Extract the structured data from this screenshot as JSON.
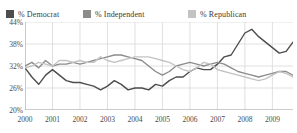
{
  "legend": {
    "items": [
      {
        "label": "% Democrat",
        "color": "#4d4d4d",
        "name": "democrat"
      },
      {
        "label": "% Independent",
        "color": "#8c8c8c",
        "name": "independent"
      },
      {
        "label": "% Republican",
        "color": "#c3c3c3",
        "name": "republican"
      }
    ]
  },
  "axes": {
    "y_ticks": [
      "44%",
      "38%",
      "32%",
      "26%",
      "20%"
    ],
    "x_ticks": [
      "2000",
      "2001",
      "2002",
      "2003",
      "2004",
      "2005",
      "2006",
      "2007",
      "2008",
      "2009"
    ]
  },
  "colors": {
    "democrat": "#4d4d4d",
    "independent": "#8c8c8c",
    "republican": "#c3c3c3",
    "grid": "#d8d8d8",
    "axis": "#a8a8a8",
    "text": "#4a4a4a"
  },
  "chart_data": {
    "type": "line",
    "title": "",
    "xlabel": "",
    "ylabel": "",
    "ylim": [
      20,
      44
    ],
    "xlim": [
      2000,
      2009.75
    ],
    "y_ticks": [
      20,
      26,
      32,
      38,
      44
    ],
    "x_ticks": [
      2000,
      2001,
      2002,
      2003,
      2004,
      2005,
      2006,
      2007,
      2008,
      2009
    ],
    "grid": true,
    "legend_position": "top",
    "series": [
      {
        "name": "% Democrat",
        "color": "#4d4d4d",
        "x": [
          2000,
          2000.25,
          2000.5,
          2000.75,
          2001,
          2001.25,
          2001.5,
          2001.75,
          2002,
          2002.25,
          2002.5,
          2002.75,
          2003,
          2003.25,
          2003.5,
          2003.75,
          2004,
          2004.25,
          2004.5,
          2004.75,
          2005,
          2005.25,
          2005.5,
          2005.75,
          2006,
          2006.25,
          2006.5,
          2006.75,
          2007,
          2007.25,
          2007.5,
          2007.75,
          2008,
          2008.25,
          2008.5,
          2008.75,
          2009,
          2009.25,
          2009.5,
          2009.75
        ],
        "values": [
          31.5,
          29.0,
          27.0,
          29.5,
          31.0,
          29.5,
          28.0,
          27.5,
          27.5,
          27.0,
          26.5,
          25.5,
          26.5,
          28.0,
          27.0,
          25.5,
          26.0,
          26.0,
          25.5,
          27.0,
          26.5,
          28.0,
          29.0,
          29.0,
          30.5,
          31.5,
          31.0,
          31.0,
          32.5,
          34.5,
          35.0,
          38.0,
          41.0,
          42.0,
          40.0,
          38.5,
          37.0,
          35.5,
          36.0,
          38.5
        ]
      },
      {
        "name": "% Independent",
        "color": "#8c8c8c",
        "x": [
          2000,
          2000.25,
          2000.5,
          2000.75,
          2001,
          2001.25,
          2001.5,
          2001.75,
          2002,
          2002.25,
          2002.5,
          2002.75,
          2003,
          2003.25,
          2003.5,
          2003.75,
          2004,
          2004.25,
          2004.5,
          2004.75,
          2005,
          2005.25,
          2005.5,
          2005.75,
          2006,
          2006.25,
          2006.5,
          2006.75,
          2007,
          2007.25,
          2007.5,
          2007.75,
          2008,
          2008.25,
          2008.5,
          2008.75,
          2009,
          2009.25,
          2009.5,
          2009.75
        ],
        "values": [
          32.0,
          33.0,
          31.5,
          33.5,
          32.0,
          32.5,
          32.5,
          33.0,
          32.5,
          33.0,
          33.5,
          34.0,
          34.5,
          35.0,
          35.0,
          34.5,
          34.0,
          33.5,
          32.0,
          30.5,
          29.5,
          30.5,
          32.0,
          32.5,
          33.0,
          32.5,
          32.0,
          32.5,
          33.0,
          32.5,
          31.5,
          30.5,
          30.0,
          29.5,
          29.0,
          29.5,
          30.0,
          30.5,
          30.5,
          29.5
        ]
      },
      {
        "name": "% Republican",
        "color": "#c3c3c3",
        "x": [
          2000,
          2000.25,
          2000.5,
          2000.75,
          2001,
          2001.25,
          2001.5,
          2001.75,
          2002,
          2002.25,
          2002.5,
          2002.75,
          2003,
          2003.25,
          2003.5,
          2003.75,
          2004,
          2004.25,
          2004.5,
          2004.75,
          2005,
          2005.25,
          2005.5,
          2005.75,
          2006,
          2006.25,
          2006.5,
          2006.75,
          2007,
          2007.25,
          2007.5,
          2007.75,
          2008,
          2008.25,
          2008.5,
          2008.75,
          2009,
          2009.25,
          2009.5,
          2009.75
        ],
        "values": [
          31.5,
          32.0,
          33.0,
          32.5,
          32.0,
          33.5,
          33.5,
          33.0,
          33.5,
          33.0,
          33.0,
          34.5,
          33.5,
          33.0,
          33.5,
          34.0,
          34.5,
          34.5,
          34.5,
          34.0,
          33.5,
          33.0,
          32.0,
          31.0,
          30.5,
          31.5,
          33.0,
          32.5,
          31.0,
          30.5,
          30.0,
          29.5,
          29.0,
          28.5,
          28.0,
          28.5,
          29.5,
          30.5,
          30.0,
          29.0
        ]
      }
    ]
  }
}
